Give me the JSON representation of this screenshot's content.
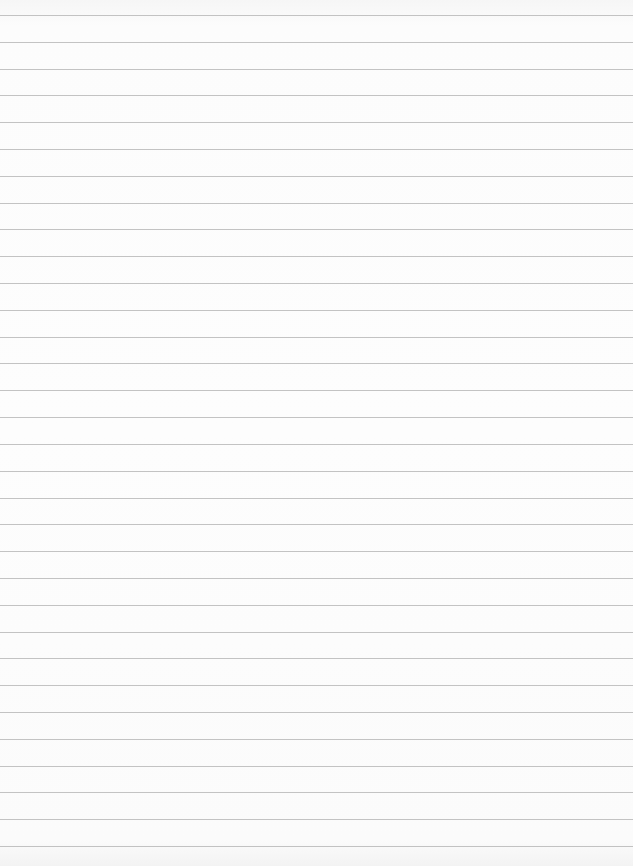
{
  "page": {
    "type": "ruled-paper",
    "rule_count": 32,
    "colors": {
      "paper": "#fbfbfb",
      "rule": "#b9b9b9"
    }
  }
}
